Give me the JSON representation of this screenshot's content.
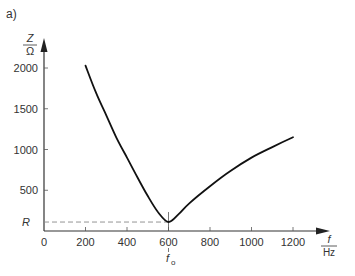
{
  "panel_label": "a)",
  "chart_data": {
    "type": "line",
    "title": "",
    "xlabel": {
      "numerator": "f",
      "denominator": "Hz"
    },
    "ylabel": {
      "numerator": "Z",
      "denominator": "Ω"
    },
    "xlim": [
      0,
      1300
    ],
    "ylim": [
      0,
      2200
    ],
    "x_ticks": [
      0,
      200,
      400,
      600,
      800,
      1000,
      1200
    ],
    "x_tick_labels": [
      "0",
      "200",
      "400",
      "600",
      "800",
      "1000",
      "1200"
    ],
    "y_ticks": [
      500,
      1000,
      1500,
      2000
    ],
    "y_tick_labels": [
      "500",
      "1000",
      "1500",
      "2000"
    ],
    "grid": false,
    "annotations": [
      {
        "label": "R",
        "axis": "y",
        "value": 110,
        "style": "dashed"
      },
      {
        "label": "f₀",
        "axis": "x",
        "value": 600,
        "style": "tick"
      }
    ],
    "series": [
      {
        "name": "Z(f)",
        "x": [
          200,
          250,
          300,
          350,
          400,
          450,
          500,
          550,
          600,
          650,
          700,
          800,
          900,
          1000,
          1100,
          1200
        ],
        "values": [
          2030,
          1700,
          1420,
          1140,
          900,
          660,
          430,
          230,
          110,
          210,
          340,
          550,
          740,
          900,
          1030,
          1150
        ]
      }
    ]
  }
}
